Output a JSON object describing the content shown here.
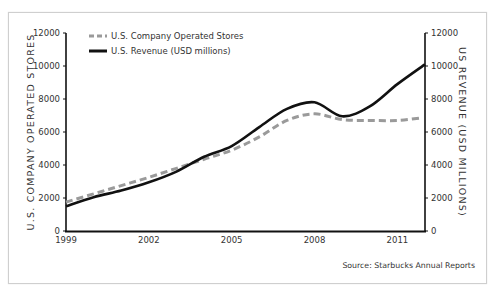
{
  "chart_data": {
    "type": "line",
    "title": "",
    "xlabel": "",
    "ylabel_left": "U.S. COMPANY OPERATED STORES",
    "ylabel_right": "US REVENUE (USD MILLIONS)",
    "x": [
      1999,
      2000,
      2001,
      2002,
      2003,
      2004,
      2005,
      2006,
      2007,
      2008,
      2009,
      2010,
      2011,
      2012
    ],
    "x_tick_labels": [
      "1999",
      "2002",
      "2005",
      "2008",
      "2011"
    ],
    "y_left_ticks": [
      "0",
      "2000",
      "4000",
      "6000",
      "8000",
      "10000",
      "12000"
    ],
    "y_right_ticks": [
      "0",
      "2000",
      "4000",
      "6000",
      "8000",
      "10000",
      "12000"
    ],
    "ylim_left": [
      0,
      12000
    ],
    "ylim_right": [
      0,
      12000
    ],
    "grid": false,
    "legend_position": "top-left",
    "series": [
      {
        "name": "U.S. Company Operated Stores",
        "axis": "left",
        "style": "dashed",
        "color": "#9a9a9a",
        "values": [
          1750,
          2250,
          2750,
          3250,
          3800,
          4350,
          4900,
          5700,
          6700,
          7100,
          6750,
          6700,
          6700,
          6850
        ]
      },
      {
        "name": "U.S. Revenue (USD millions)",
        "axis": "right",
        "style": "solid",
        "color": "#111111",
        "values": [
          1500,
          2050,
          2450,
          2950,
          3600,
          4500,
          5150,
          6300,
          7400,
          7800,
          6950,
          7550,
          8900,
          10100
        ]
      }
    ],
    "annotations": [
      "Source: Starbucks Annual Reports"
    ]
  },
  "legend": {
    "items": [
      {
        "label": "U.S. Company Operated Stores"
      },
      {
        "label": "U.S. Revenue (USD millions)"
      }
    ]
  },
  "source_text": "Source: Starbucks Annual Reports"
}
